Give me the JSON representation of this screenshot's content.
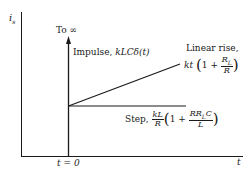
{
  "diagram": {
    "y_axis_label": "i",
    "y_axis_label_sub": "s",
    "x_axis_label": "t",
    "origin_label": "t = 0",
    "impulse": {
      "top_label": "To ∞",
      "label_text": "Impulse, ",
      "label_math": "kLCδ(t)"
    },
    "linear_rise": {
      "label_text": "Linear rise,",
      "coef": "kt",
      "one_plus": "1 +",
      "frac_num": "R",
      "frac_num_sub": "L",
      "frac_den": "R"
    },
    "step": {
      "label_text": "Step, ",
      "coef_num": "kL",
      "coef_den": "R",
      "one_plus": "1 +",
      "frac_num": "RR",
      "frac_num_sub": "L",
      "frac_num_tail": "C",
      "frac_den": "L"
    },
    "colors": {
      "line": "#1a1a1a",
      "background": "#ffffff"
    }
  }
}
